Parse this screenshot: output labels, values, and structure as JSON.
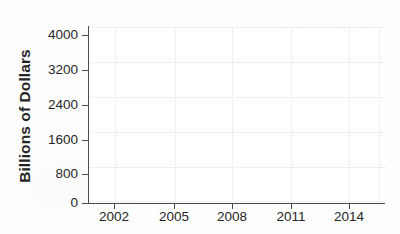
{
  "chart_data": {
    "type": "line",
    "title": "",
    "subtitle": "",
    "xlabel": "",
    "ylabel": "Billions of Dollars",
    "x_tick_labels": [
      "2002",
      "2005",
      "2008",
      "2011",
      "2014"
    ],
    "x_tick_values": [
      2002,
      2005,
      2008,
      2011,
      2014
    ],
    "y_tick_labels": [
      "0",
      "800",
      "1600",
      "2400",
      "3200",
      "4000"
    ],
    "y_tick_values": [
      0,
      800,
      1600,
      2400,
      3200,
      4000
    ],
    "xlim": [
      2000.8,
      2015.3
    ],
    "ylim": [
      0,
      4000
    ],
    "grid": true,
    "legend": false,
    "series": [],
    "values": [],
    "categories": [],
    "annotations": [],
    "note": "empty plot frame; no data plotted inside the axes"
  },
  "axes": {
    "y_title": "Billions of Dollars",
    "y_ticks": [
      {
        "label": "4000",
        "value": 4000,
        "top": 35
      },
      {
        "label": "3200",
        "value": 3200,
        "top": 70
      },
      {
        "label": "2400",
        "value": 2400,
        "top": 105
      },
      {
        "label": "1600",
        "value": 1600,
        "top": 140
      },
      {
        "label": "800",
        "value": 800,
        "top": 174
      },
      {
        "label": "0",
        "value": 0,
        "top": 203
      }
    ],
    "x_ticks": [
      {
        "label": "2002",
        "value": 2002,
        "left": 114
      },
      {
        "label": "2005",
        "value": 2005,
        "left": 174
      },
      {
        "label": "2008",
        "value": 2008,
        "left": 232
      },
      {
        "label": "2011",
        "value": 2011,
        "left": 291
      },
      {
        "label": "2014",
        "value": 2014,
        "left": 349
      }
    ],
    "gridlines_h": [
      0,
      35,
      70,
      105,
      140,
      174
    ],
    "gridlines_v": [
      27,
      87,
      144,
      203,
      261,
      291
    ]
  },
  "colors": {
    "background": "#fefefe",
    "plot_background": "#ffffff",
    "axis_line": "#4a4a4a",
    "gridline": "#e3e3e3",
    "tick_text": "#262626",
    "axis_title": "#252525"
  }
}
